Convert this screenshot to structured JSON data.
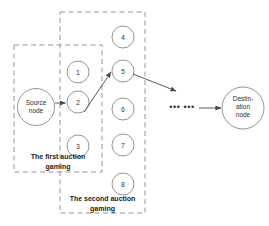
{
  "diagram": {
    "colors": {
      "stroke": "#8a8a8a",
      "dashed_box": "#8a8a8a",
      "arrow": "#4a4a4a",
      "text": "#2e2e2e",
      "background": "#ffffff"
    },
    "source_node": {
      "label_line1": "Source",
      "label_line2": "node"
    },
    "destination_node": {
      "label_line1": "Destin-",
      "label_line2": "ation",
      "label_line3": "node"
    },
    "relay_nodes": [
      {
        "id": "1",
        "label": "1",
        "cx": 78,
        "cy": 72,
        "r": 11
      },
      {
        "id": "2",
        "label": "2",
        "cx": 78,
        "cy": 102,
        "r": 11
      },
      {
        "id": "3",
        "label": "3",
        "cx": 78,
        "cy": 146,
        "r": 11
      },
      {
        "id": "4",
        "label": "4",
        "cx": 123,
        "cy": 37,
        "r": 11
      },
      {
        "id": "5",
        "label": "5",
        "cx": 123,
        "cy": 71,
        "r": 11
      },
      {
        "id": "6",
        "label": "6",
        "cx": 123,
        "cy": 109,
        "r": 11
      },
      {
        "id": "7",
        "label": "7",
        "cx": 123,
        "cy": 145,
        "r": 11
      },
      {
        "id": "8",
        "label": "8",
        "cx": 123,
        "cy": 184,
        "r": 11
      }
    ],
    "groups": [
      {
        "name": "first-auction-gaming",
        "caption_line1": "The first auction",
        "caption_line2": "gaming",
        "x": 14,
        "y": 45,
        "w": 88,
        "h": 127
      },
      {
        "name": "second-auction-gaming",
        "caption_line1": "The second auction",
        "caption_line2": "gaming",
        "x": 60,
        "y": 12,
        "w": 85,
        "h": 201
      }
    ],
    "ellipsis": "••• •••",
    "edges": [
      {
        "from": "source-node",
        "to": "node-2"
      },
      {
        "from": "node-2",
        "to": "node-5"
      },
      {
        "from": "node-5",
        "to": "ellipsis-region"
      },
      {
        "from": "ellipsis-region",
        "to": "destination-node"
      }
    ]
  }
}
